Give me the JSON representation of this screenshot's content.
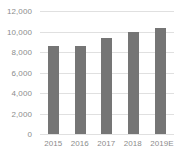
{
  "chart_data": {
    "type": "bar",
    "title": "",
    "subtitle": "",
    "xlabel": "",
    "ylabel": "",
    "categories": [
      "2015",
      "2016",
      "2017",
      "2018",
      "2019E"
    ],
    "values": [
      8600,
      8600,
      9400,
      10000,
      10350
    ],
    "series": [
      {
        "name": "",
        "values": [
          8600,
          8600,
          9400,
          10000,
          10350
        ]
      }
    ],
    "ylim": [
      0,
      12000
    ],
    "ytick_values": [
      12000,
      10000,
      8000,
      6000,
      4000,
      2000,
      0
    ],
    "ytick_labels": [
      "12,000",
      "10,000",
      "8,000",
      "6,000",
      "4,000",
      "2,000",
      "0"
    ],
    "grid": true,
    "grid_axis": "y",
    "legend": false,
    "legend_position": "none",
    "bar_color": "#757575",
    "gridline_color": "#e0e0e0",
    "tick_label_color": "#8c8c8c",
    "background_color": "#ffffff",
    "annotations": []
  }
}
